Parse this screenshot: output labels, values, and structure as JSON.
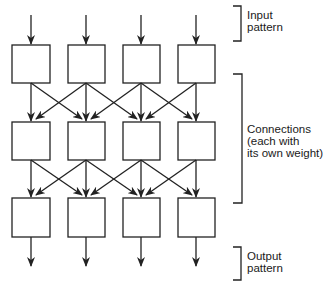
{
  "diagram": {
    "layers": [
      {
        "name": "input-layer",
        "units": 4
      },
      {
        "name": "hidden-layer",
        "units": 4
      },
      {
        "name": "output-layer",
        "units": 4
      }
    ],
    "connections": "each unit connects to itself-column and adjacent columns",
    "labels": {
      "input": "Input\npattern",
      "connections": "Connections\n(each with\nits own weight)",
      "output": "Output\npattern"
    },
    "colors": {
      "stroke": "#222222",
      "background": "#ffffff"
    }
  }
}
